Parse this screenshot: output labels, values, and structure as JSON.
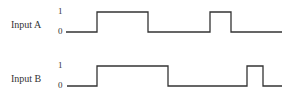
{
  "diagram": {
    "type": "timing-diagram",
    "stroke_color": "#333333",
    "signals": [
      {
        "name": "Input A",
        "high_label": "1",
        "low_label": "0",
        "transitions_x": [
          66,
          97,
          148,
          210,
          231,
          282
        ],
        "levels": [
          0,
          1,
          0,
          1,
          0
        ],
        "y_high": 12,
        "y_low": 32
      },
      {
        "name": "Input B",
        "high_label": "1",
        "low_label": "0",
        "transitions_x": [
          67,
          97,
          168,
          247,
          263,
          282
        ],
        "levels": [
          0,
          1,
          0,
          1,
          0
        ],
        "y_high": 66,
        "y_low": 86
      }
    ]
  }
}
